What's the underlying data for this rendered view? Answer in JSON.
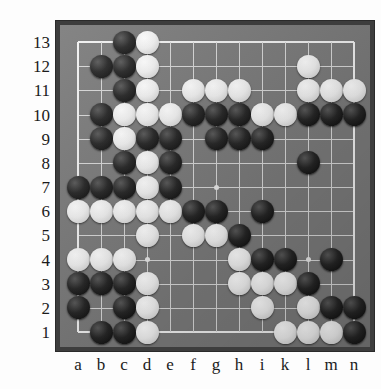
{
  "board": {
    "title": "Go board position",
    "size": 13,
    "columns": [
      "a",
      "b",
      "c",
      "d",
      "e",
      "f",
      "g",
      "h",
      "i",
      "k",
      "l",
      "m",
      "n"
    ],
    "rows": [
      "13",
      "12",
      "11",
      "10",
      "9",
      "8",
      "7",
      "6",
      "5",
      "4",
      "3",
      "2",
      "1"
    ],
    "colors": {
      "board": "#7b7b7b",
      "frame": "#3d3d3d",
      "grid_line": "#d8d8d8",
      "border_line": "#f2f2f2",
      "black_stone": "#101010",
      "white_stone": "#f4f4f4",
      "label_text": "#1b1b1b",
      "page_background": "#fdfdfd"
    },
    "star_points": [
      {
        "col": "d",
        "row": 10
      },
      {
        "col": "l",
        "row": 10
      },
      {
        "col": "g",
        "row": 7
      },
      {
        "col": "d",
        "row": 4
      },
      {
        "col": "l",
        "row": 4
      }
    ],
    "stones": [
      {
        "col": "c",
        "row": 13,
        "color": "black"
      },
      {
        "col": "d",
        "row": 13,
        "color": "white"
      },
      {
        "col": "b",
        "row": 12,
        "color": "black"
      },
      {
        "col": "c",
        "row": 12,
        "color": "black"
      },
      {
        "col": "d",
        "row": 12,
        "color": "white"
      },
      {
        "col": "l",
        "row": 12,
        "color": "white"
      },
      {
        "col": "c",
        "row": 11,
        "color": "black"
      },
      {
        "col": "d",
        "row": 11,
        "color": "white"
      },
      {
        "col": "f",
        "row": 11,
        "color": "white"
      },
      {
        "col": "g",
        "row": 11,
        "color": "white"
      },
      {
        "col": "h",
        "row": 11,
        "color": "white"
      },
      {
        "col": "l",
        "row": 11,
        "color": "white"
      },
      {
        "col": "m",
        "row": 11,
        "color": "white"
      },
      {
        "col": "n",
        "row": 11,
        "color": "white"
      },
      {
        "col": "b",
        "row": 10,
        "color": "black"
      },
      {
        "col": "c",
        "row": 10,
        "color": "white"
      },
      {
        "col": "d",
        "row": 10,
        "color": "white"
      },
      {
        "col": "e",
        "row": 10,
        "color": "white"
      },
      {
        "col": "f",
        "row": 10,
        "color": "black"
      },
      {
        "col": "g",
        "row": 10,
        "color": "black"
      },
      {
        "col": "h",
        "row": 10,
        "color": "black"
      },
      {
        "col": "i",
        "row": 10,
        "color": "white"
      },
      {
        "col": "k",
        "row": 10,
        "color": "white"
      },
      {
        "col": "l",
        "row": 10,
        "color": "black"
      },
      {
        "col": "m",
        "row": 10,
        "color": "black"
      },
      {
        "col": "n",
        "row": 10,
        "color": "black"
      },
      {
        "col": "b",
        "row": 9,
        "color": "black"
      },
      {
        "col": "c",
        "row": 9,
        "color": "white"
      },
      {
        "col": "d",
        "row": 9,
        "color": "black"
      },
      {
        "col": "e",
        "row": 9,
        "color": "black"
      },
      {
        "col": "g",
        "row": 9,
        "color": "black"
      },
      {
        "col": "h",
        "row": 9,
        "color": "black"
      },
      {
        "col": "i",
        "row": 9,
        "color": "black"
      },
      {
        "col": "c",
        "row": 8,
        "color": "black"
      },
      {
        "col": "d",
        "row": 8,
        "color": "white"
      },
      {
        "col": "e",
        "row": 8,
        "color": "black"
      },
      {
        "col": "l",
        "row": 8,
        "color": "black"
      },
      {
        "col": "a",
        "row": 7,
        "color": "black"
      },
      {
        "col": "b",
        "row": 7,
        "color": "black"
      },
      {
        "col": "c",
        "row": 7,
        "color": "black"
      },
      {
        "col": "d",
        "row": 7,
        "color": "white"
      },
      {
        "col": "e",
        "row": 7,
        "color": "black"
      },
      {
        "col": "a",
        "row": 6,
        "color": "white"
      },
      {
        "col": "b",
        "row": 6,
        "color": "white"
      },
      {
        "col": "c",
        "row": 6,
        "color": "white"
      },
      {
        "col": "d",
        "row": 6,
        "color": "white"
      },
      {
        "col": "e",
        "row": 6,
        "color": "white"
      },
      {
        "col": "f",
        "row": 6,
        "color": "black"
      },
      {
        "col": "g",
        "row": 6,
        "color": "black"
      },
      {
        "col": "i",
        "row": 6,
        "color": "black"
      },
      {
        "col": "d",
        "row": 5,
        "color": "white"
      },
      {
        "col": "f",
        "row": 5,
        "color": "white"
      },
      {
        "col": "g",
        "row": 5,
        "color": "white"
      },
      {
        "col": "h",
        "row": 5,
        "color": "black"
      },
      {
        "col": "a",
        "row": 4,
        "color": "white"
      },
      {
        "col": "b",
        "row": 4,
        "color": "white"
      },
      {
        "col": "c",
        "row": 4,
        "color": "white"
      },
      {
        "col": "h",
        "row": 4,
        "color": "white"
      },
      {
        "col": "i",
        "row": 4,
        "color": "black"
      },
      {
        "col": "k",
        "row": 4,
        "color": "black"
      },
      {
        "col": "m",
        "row": 4,
        "color": "black"
      },
      {
        "col": "a",
        "row": 3,
        "color": "black"
      },
      {
        "col": "b",
        "row": 3,
        "color": "black"
      },
      {
        "col": "c",
        "row": 3,
        "color": "black"
      },
      {
        "col": "d",
        "row": 3,
        "color": "white"
      },
      {
        "col": "h",
        "row": 3,
        "color": "white"
      },
      {
        "col": "i",
        "row": 3,
        "color": "white"
      },
      {
        "col": "k",
        "row": 3,
        "color": "white"
      },
      {
        "col": "l",
        "row": 3,
        "color": "black"
      },
      {
        "col": "a",
        "row": 2,
        "color": "black"
      },
      {
        "col": "c",
        "row": 2,
        "color": "black"
      },
      {
        "col": "d",
        "row": 2,
        "color": "white"
      },
      {
        "col": "i",
        "row": 2,
        "color": "white"
      },
      {
        "col": "l",
        "row": 2,
        "color": "white"
      },
      {
        "col": "m",
        "row": 2,
        "color": "black"
      },
      {
        "col": "n",
        "row": 2,
        "color": "black"
      },
      {
        "col": "b",
        "row": 1,
        "color": "black"
      },
      {
        "col": "c",
        "row": 1,
        "color": "black"
      },
      {
        "col": "d",
        "row": 1,
        "color": "white"
      },
      {
        "col": "k",
        "row": 1,
        "color": "white"
      },
      {
        "col": "l",
        "row": 1,
        "color": "white"
      },
      {
        "col": "m",
        "row": 1,
        "color": "white"
      },
      {
        "col": "n",
        "row": 1,
        "color": "black"
      }
    ]
  }
}
